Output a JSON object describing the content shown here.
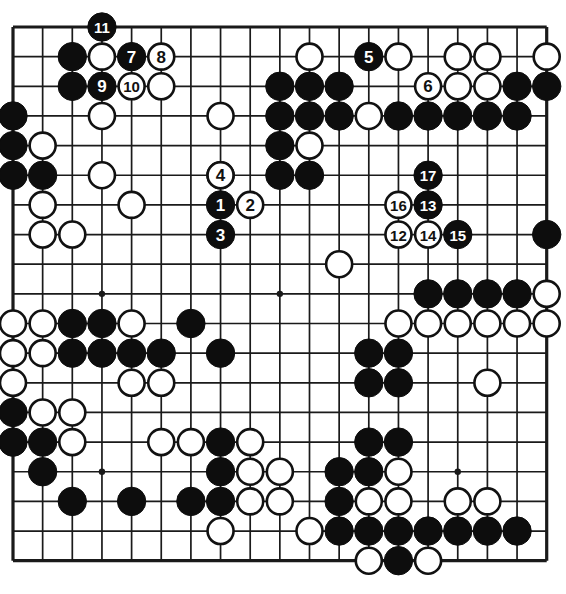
{
  "diagram": {
    "kind": "go-board-diagram",
    "board_size": 19,
    "geometry": {
      "origin_x": 13,
      "origin_y": 27,
      "spacing": 29.65,
      "stone_radius": 14.2,
      "label_font_size": 17
    },
    "colors": {
      "line": "#1a1a1a",
      "black_stone": "#0d0d0d",
      "white_stone": "#ffffff",
      "white_stone_edge": "#111111",
      "background": "#ffffff",
      "label_on_black": "#ffffff",
      "label_on_white": "#111111"
    },
    "star_points": [
      {
        "col": 3,
        "row": 3
      },
      {
        "col": 9,
        "row": 3
      },
      {
        "col": 15,
        "row": 3
      },
      {
        "col": 3,
        "row": 9
      },
      {
        "col": 9,
        "row": 9
      },
      {
        "col": 15,
        "row": 9
      },
      {
        "col": 3,
        "row": 15
      },
      {
        "col": 9,
        "row": 15
      },
      {
        "col": 15,
        "row": 15
      }
    ],
    "stones": [
      {
        "col": 2,
        "row": 1,
        "color": "black"
      },
      {
        "col": 3,
        "row": 1,
        "color": "white"
      },
      {
        "col": 2,
        "row": 2,
        "color": "black"
      },
      {
        "col": 5,
        "row": 2,
        "color": "white"
      },
      {
        "col": 0,
        "row": 3,
        "color": "black"
      },
      {
        "col": 3,
        "row": 3,
        "color": "white"
      },
      {
        "col": 0,
        "row": 4,
        "color": "black"
      },
      {
        "col": 1,
        "row": 4,
        "color": "white"
      },
      {
        "col": 0,
        "row": 5,
        "color": "black"
      },
      {
        "col": 1,
        "row": 5,
        "color": "black"
      },
      {
        "col": 3,
        "row": 5,
        "color": "white"
      },
      {
        "col": 1,
        "row": 6,
        "color": "white"
      },
      {
        "col": 4,
        "row": 6,
        "color": "white"
      },
      {
        "col": 1,
        "row": 7,
        "color": "white"
      },
      {
        "col": 2,
        "row": 7,
        "color": "white"
      },
      {
        "col": 10,
        "row": 1,
        "color": "white"
      },
      {
        "col": 9,
        "row": 2,
        "color": "black"
      },
      {
        "col": 10,
        "row": 2,
        "color": "black"
      },
      {
        "col": 11,
        "row": 2,
        "color": "black"
      },
      {
        "col": 13,
        "row": 1,
        "color": "white"
      },
      {
        "col": 15,
        "row": 1,
        "color": "white"
      },
      {
        "col": 16,
        "row": 1,
        "color": "white"
      },
      {
        "col": 18,
        "row": 1,
        "color": "white"
      },
      {
        "col": 15,
        "row": 2,
        "color": "white"
      },
      {
        "col": 16,
        "row": 2,
        "color": "white"
      },
      {
        "col": 17,
        "row": 2,
        "color": "black"
      },
      {
        "col": 18,
        "row": 2,
        "color": "black"
      },
      {
        "col": 7,
        "row": 3,
        "color": "white"
      },
      {
        "col": 9,
        "row": 3,
        "color": "black"
      },
      {
        "col": 10,
        "row": 3,
        "color": "black"
      },
      {
        "col": 11,
        "row": 3,
        "color": "black"
      },
      {
        "col": 12,
        "row": 3,
        "color": "white"
      },
      {
        "col": 13,
        "row": 3,
        "color": "black"
      },
      {
        "col": 14,
        "row": 3,
        "color": "black"
      },
      {
        "col": 15,
        "row": 3,
        "color": "black"
      },
      {
        "col": 16,
        "row": 3,
        "color": "black"
      },
      {
        "col": 17,
        "row": 3,
        "color": "black"
      },
      {
        "col": 9,
        "row": 4,
        "color": "black"
      },
      {
        "col": 10,
        "row": 4,
        "color": "white"
      },
      {
        "col": 9,
        "row": 5,
        "color": "black"
      },
      {
        "col": 10,
        "row": 5,
        "color": "black"
      },
      {
        "col": 7,
        "row": 5,
        "color": "white"
      },
      {
        "col": 18,
        "row": 7,
        "color": "black"
      },
      {
        "col": 11,
        "row": 8,
        "color": "white"
      },
      {
        "col": 1,
        "row": 10,
        "color": "white"
      },
      {
        "col": 2,
        "row": 10,
        "color": "black"
      },
      {
        "col": 3,
        "row": 10,
        "color": "black"
      },
      {
        "col": 4,
        "row": 10,
        "color": "white"
      },
      {
        "col": 6,
        "row": 10,
        "color": "black"
      },
      {
        "col": 14,
        "row": 9,
        "color": "black"
      },
      {
        "col": 15,
        "row": 9,
        "color": "black"
      },
      {
        "col": 16,
        "row": 9,
        "color": "black"
      },
      {
        "col": 17,
        "row": 9,
        "color": "black"
      },
      {
        "col": 18,
        "row": 9,
        "color": "white"
      },
      {
        "col": 0,
        "row": 10,
        "color": "white"
      },
      {
        "col": 13,
        "row": 10,
        "color": "white"
      },
      {
        "col": 14,
        "row": 10,
        "color": "white"
      },
      {
        "col": 15,
        "row": 10,
        "color": "white"
      },
      {
        "col": 16,
        "row": 10,
        "color": "white"
      },
      {
        "col": 17,
        "row": 10,
        "color": "white"
      },
      {
        "col": 18,
        "row": 10,
        "color": "white"
      },
      {
        "col": 0,
        "row": 11,
        "color": "white"
      },
      {
        "col": 1,
        "row": 11,
        "color": "white"
      },
      {
        "col": 2,
        "row": 11,
        "color": "black"
      },
      {
        "col": 3,
        "row": 11,
        "color": "black"
      },
      {
        "col": 4,
        "row": 11,
        "color": "black"
      },
      {
        "col": 5,
        "row": 11,
        "color": "black"
      },
      {
        "col": 7,
        "row": 11,
        "color": "black"
      },
      {
        "col": 12,
        "row": 11,
        "color": "black"
      },
      {
        "col": 13,
        "row": 11,
        "color": "black"
      },
      {
        "col": 0,
        "row": 12,
        "color": "white"
      },
      {
        "col": 4,
        "row": 12,
        "color": "white"
      },
      {
        "col": 5,
        "row": 12,
        "color": "white"
      },
      {
        "col": 12,
        "row": 12,
        "color": "black"
      },
      {
        "col": 13,
        "row": 12,
        "color": "black"
      },
      {
        "col": 16,
        "row": 12,
        "color": "white"
      },
      {
        "col": 0,
        "row": 13,
        "color": "black"
      },
      {
        "col": 1,
        "row": 13,
        "color": "white"
      },
      {
        "col": 2,
        "row": 13,
        "color": "white"
      },
      {
        "col": 0,
        "row": 14,
        "color": "black"
      },
      {
        "col": 1,
        "row": 14,
        "color": "black"
      },
      {
        "col": 2,
        "row": 14,
        "color": "white"
      },
      {
        "col": 5,
        "row": 14,
        "color": "white"
      },
      {
        "col": 8,
        "row": 14,
        "color": "white"
      },
      {
        "col": 12,
        "row": 14,
        "color": "black"
      },
      {
        "col": 13,
        "row": 14,
        "color": "black"
      },
      {
        "col": 1,
        "row": 15,
        "color": "black"
      },
      {
        "col": 11,
        "row": 15,
        "color": "black"
      },
      {
        "col": 12,
        "row": 15,
        "color": "black"
      },
      {
        "col": 13,
        "row": 15,
        "color": "white"
      },
      {
        "col": 6,
        "row": 14,
        "color": "white"
      },
      {
        "col": 7,
        "row": 14,
        "color": "black"
      },
      {
        "col": 8,
        "row": 15,
        "color": "white"
      },
      {
        "col": 9,
        "row": 15,
        "color": "white"
      },
      {
        "col": 7,
        "row": 15,
        "color": "black"
      },
      {
        "col": 2,
        "row": 16,
        "color": "black"
      },
      {
        "col": 4,
        "row": 16,
        "color": "black"
      },
      {
        "col": 6,
        "row": 16,
        "color": "black"
      },
      {
        "col": 7,
        "row": 16,
        "color": "black"
      },
      {
        "col": 8,
        "row": 16,
        "color": "white"
      },
      {
        "col": 9,
        "row": 16,
        "color": "white"
      },
      {
        "col": 11,
        "row": 16,
        "color": "black"
      },
      {
        "col": 12,
        "row": 16,
        "color": "white"
      },
      {
        "col": 13,
        "row": 16,
        "color": "white"
      },
      {
        "col": 15,
        "row": 16,
        "color": "white"
      },
      {
        "col": 16,
        "row": 16,
        "color": "white"
      },
      {
        "col": 7,
        "row": 17,
        "color": "white"
      },
      {
        "col": 10,
        "row": 17,
        "color": "white"
      },
      {
        "col": 11,
        "row": 17,
        "color": "black"
      },
      {
        "col": 12,
        "row": 17,
        "color": "black"
      },
      {
        "col": 13,
        "row": 17,
        "color": "black"
      },
      {
        "col": 14,
        "row": 17,
        "color": "black"
      },
      {
        "col": 15,
        "row": 17,
        "color": "black"
      },
      {
        "col": 16,
        "row": 17,
        "color": "black"
      },
      {
        "col": 17,
        "row": 17,
        "color": "black"
      },
      {
        "col": 12,
        "row": 18,
        "color": "white"
      },
      {
        "col": 13,
        "row": 18,
        "color": "black"
      },
      {
        "col": 14,
        "row": 18,
        "color": "white"
      }
    ],
    "numbered_moves": [
      {
        "number": "1",
        "col": 7,
        "row": 6,
        "color": "black"
      },
      {
        "number": "2",
        "col": 8,
        "row": 6,
        "color": "white"
      },
      {
        "number": "3",
        "col": 7,
        "row": 7,
        "color": "black"
      },
      {
        "number": "4",
        "col": 7,
        "row": 5,
        "color": "white"
      },
      {
        "number": "5",
        "col": 12,
        "row": 1,
        "color": "black"
      },
      {
        "number": "6",
        "col": 14,
        "row": 2,
        "color": "white"
      },
      {
        "number": "7",
        "col": 4,
        "row": 1,
        "color": "black"
      },
      {
        "number": "8",
        "col": 5,
        "row": 1,
        "color": "white"
      },
      {
        "number": "9",
        "col": 3,
        "row": 2,
        "color": "black"
      },
      {
        "number": "10",
        "col": 4,
        "row": 2,
        "color": "white"
      },
      {
        "number": "11",
        "col": 3,
        "row": 0,
        "color": "black"
      },
      {
        "number": "12",
        "col": 13,
        "row": 7,
        "color": "white"
      },
      {
        "number": "13",
        "col": 14,
        "row": 6,
        "color": "black"
      },
      {
        "number": "14",
        "col": 14,
        "row": 7,
        "color": "white"
      },
      {
        "number": "15",
        "col": 15,
        "row": 7,
        "color": "black"
      },
      {
        "number": "16",
        "col": 13,
        "row": 6,
        "color": "white"
      },
      {
        "number": "17",
        "col": 14,
        "row": 5,
        "color": "black"
      }
    ]
  }
}
